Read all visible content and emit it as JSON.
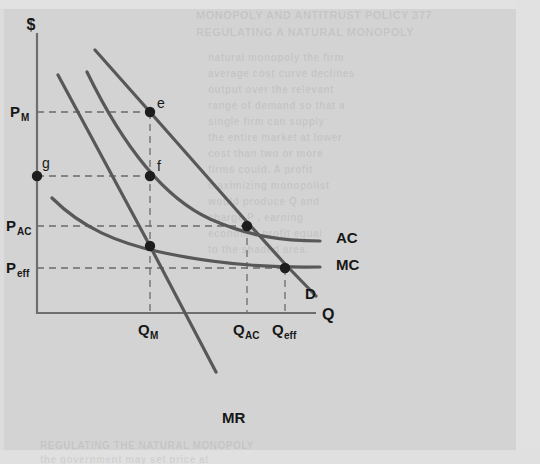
{
  "figure": {
    "kind": "economics-diagram",
    "topic": "natural-monopoly",
    "background_color": "#d3d3d3",
    "curve_color": "#585858",
    "axis_color": "#6e6e6e",
    "point_color": "#1d1d1d"
  },
  "axes": {
    "y_label": "$",
    "x_label": "Q",
    "y_ticks": [
      {
        "id": "pm",
        "label": "P",
        "sub": "M",
        "y": 112
      },
      {
        "id": "pac",
        "label": "P",
        "sub": "AC",
        "y": 226
      },
      {
        "id": "peff",
        "label": "P",
        "sub": "eff",
        "y": 268
      }
    ],
    "x_ticks": [
      {
        "id": "qm",
        "label": "Q",
        "sub": "M",
        "x": 150
      },
      {
        "id": "qac",
        "label": "Q",
        "sub": "AC",
        "x": 247
      },
      {
        "id": "qeff",
        "label": "Q",
        "sub": "eff",
        "x": 285
      }
    ]
  },
  "curves": [
    {
      "id": "demand",
      "label": "D",
      "label_x": 305,
      "label_y": 299
    },
    {
      "id": "marginal-revenue",
      "label": "MR",
      "label_x": 222,
      "label_y": 423
    },
    {
      "id": "average-cost",
      "label": "AC",
      "label_x": 336,
      "label_y": 243
    },
    {
      "id": "marginal-cost",
      "label": "MC",
      "label_x": 336,
      "label_y": 270
    }
  ],
  "points": [
    {
      "id": "e",
      "label": "e",
      "x": 150,
      "y": 112,
      "label_dx": 7,
      "label_dy": -6
    },
    {
      "id": "f",
      "label": "f",
      "x": 150,
      "y": 176,
      "label_dx": 7,
      "label_dy": -6
    },
    {
      "id": "g",
      "label": "g",
      "x": 37,
      "y": 176,
      "label_dx": 5,
      "label_dy": -9
    },
    {
      "id": "ac_eq",
      "label": "",
      "x": 247,
      "y": 226,
      "label_dx": 0,
      "label_dy": 0
    },
    {
      "id": "eff_eq",
      "label": "",
      "x": 285,
      "y": 268,
      "label_dx": 0,
      "label_dy": 0
    },
    {
      "id": "mr_mc",
      "label": "",
      "x": 150,
      "y": 246,
      "label_dx": 0,
      "label_dy": 0
    }
  ],
  "chart_data": {
    "type": "line",
    "title": "",
    "xlabel": "Q",
    "ylabel": "$",
    "grid": false,
    "legend": "inline-curve-labels",
    "series": [
      {
        "name": "D",
        "note": "downward-sloping demand curve"
      },
      {
        "name": "MR",
        "note": "marginal revenue, twice the slope of demand"
      },
      {
        "name": "AC",
        "note": "declining average cost (natural monopoly)"
      },
      {
        "name": "MC",
        "note": "declining marginal cost below AC"
      }
    ],
    "annotations": [
      "e = monopoly price/quantity on demand curve",
      "f = point on AC above monopoly quantity",
      "g = vertical-axis price matching point f",
      "P_M > P_AC > P_eff",
      "Q_M < Q_AC < Q_eff"
    ]
  },
  "ghost_text": [
    {
      "text": "MONOPOLY AND ANTITRUST POLICY  377",
      "x": 196,
      "y": 9,
      "size": 11
    },
    {
      "text": "REGULATING A NATURAL MONOPOLY",
      "x": 196,
      "y": 26,
      "size": 11
    },
    {
      "text": "natural monopoly the firm",
      "x": 208,
      "y": 52,
      "size": 10
    },
    {
      "text": "average cost curve declines",
      "x": 208,
      "y": 68,
      "size": 10
    },
    {
      "text": "output over the relevant",
      "x": 208,
      "y": 84,
      "size": 10
    },
    {
      "text": "range of demand so that a",
      "x": 208,
      "y": 100,
      "size": 10
    },
    {
      "text": "single firm can supply",
      "x": 208,
      "y": 116,
      "size": 10
    },
    {
      "text": "the entire market at lower",
      "x": 208,
      "y": 132,
      "size": 10
    },
    {
      "text": "cost than two or more",
      "x": 208,
      "y": 148,
      "size": 10
    },
    {
      "text": "firms could. A profit",
      "x": 208,
      "y": 164,
      "size": 10
    },
    {
      "text": "maximizing monopolist",
      "x": 208,
      "y": 180,
      "size": 10
    },
    {
      "text": "would produce Q and",
      "x": 208,
      "y": 196,
      "size": 10
    },
    {
      "text": "charge P , earning",
      "x": 208,
      "y": 212,
      "size": 10
    },
    {
      "text": "economic profit equal",
      "x": 208,
      "y": 228,
      "size": 10
    },
    {
      "text": "to the shaded area.",
      "x": 208,
      "y": 244,
      "size": 10
    },
    {
      "text": "REGULATING THE NATURAL MONOPOLY",
      "x": 40,
      "y": 440,
      "size": 10
    },
    {
      "text": "the government may set price at",
      "x": 40,
      "y": 454,
      "size": 10
    }
  ]
}
